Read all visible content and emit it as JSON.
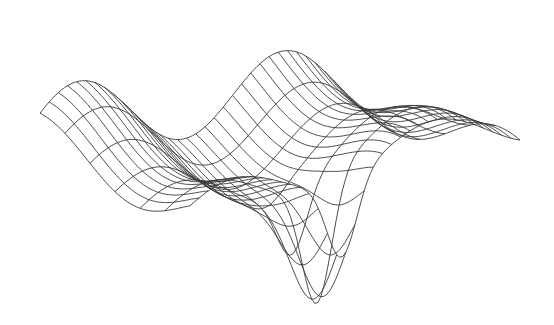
{
  "chart_data": {
    "type": "surface-wireframe",
    "title": "",
    "xlabel": "",
    "ylabel": "",
    "zlabel": "",
    "axes_visible": false,
    "grid": false,
    "legend": null,
    "colors": {
      "background": "#ffffff",
      "line": "#3a3a3a"
    },
    "mesh": {
      "u_lines": 36,
      "v_samples": 60,
      "v_lines": 6
    }
  }
}
